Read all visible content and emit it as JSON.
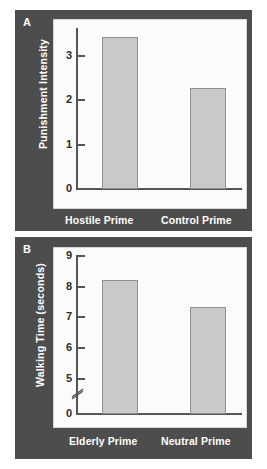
{
  "figure": {
    "background_color": "#ffffff",
    "panel_color": "#4d4d4d",
    "plot_color": "#fbfbfb",
    "bar_fill": "#c9c9c9",
    "bar_stroke": "#8f8f8f",
    "axis_color": "#555555",
    "label_color": "#ffffff"
  },
  "panels": {
    "a": {
      "letter": "A"
    },
    "b": {
      "letter": "B"
    }
  },
  "chart_data": [
    {
      "type": "bar",
      "panel": "A",
      "title": "",
      "xlabel": "",
      "ylabel": "Punishment Intensity",
      "categories": [
        "Hostile Prime",
        "Control Prime"
      ],
      "values": [
        3.4,
        2.25
      ],
      "ylim": [
        0,
        3.75
      ],
      "yticks": [
        0,
        1,
        2,
        3
      ],
      "ytick_labels": [
        "0",
        "1",
        "2",
        "3"
      ],
      "grid": false,
      "legend": "none",
      "axis_break": false
    },
    {
      "type": "bar",
      "panel": "B",
      "title": "",
      "xlabel": "",
      "ylabel": "Walking Time (seconds)",
      "categories": [
        "Elderly Prime",
        "Neutral Prime"
      ],
      "values": [
        8.17,
        7.3
      ],
      "ylim": [
        0,
        9.5
      ],
      "yticks": [
        0,
        5,
        6,
        7,
        8,
        9
      ],
      "ytick_labels": [
        "0",
        "5",
        "6",
        "7",
        "8",
        "9"
      ],
      "grid": false,
      "legend": "none",
      "axis_break": true,
      "axis_break_between": [
        0,
        5
      ]
    }
  ]
}
